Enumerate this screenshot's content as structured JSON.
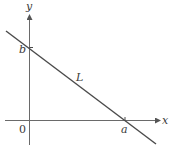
{
  "diagram": {
    "type": "coordinate-plane-line",
    "axes": {
      "x_label": "x",
      "y_label": "y",
      "origin_label": "0"
    },
    "line": {
      "label": "L",
      "x_intercept_label": "a",
      "y_intercept_label": "b"
    },
    "colors": {
      "axis": "#6a6a6a",
      "line": "#4a4a4a",
      "text": "#3a3a3a"
    }
  }
}
